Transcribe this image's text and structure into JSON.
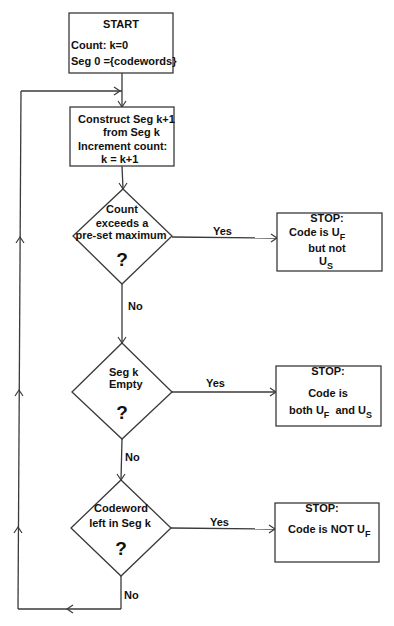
{
  "colors": {
    "background": "#ffffff",
    "line": "#3a3a3a",
    "text": "#111111"
  },
  "start": {
    "title": "START",
    "lines": [
      "Count: k=0",
      "Seg 0 ={codewords}"
    ]
  },
  "construct": {
    "lines": [
      "Construct Seg k+1",
      "from Seg k",
      "Increment count:",
      "k = k+1"
    ]
  },
  "decisions": [
    {
      "lines": [
        "Count",
        "exceeds a",
        "pre-set maximum"
      ],
      "mark": "?",
      "yes_label": "Yes",
      "no_label": "No"
    },
    {
      "lines": [
        "Seg k",
        "Empty"
      ],
      "mark": "?",
      "yes_label": "Yes",
      "no_label": "No"
    },
    {
      "lines": [
        "Codeword",
        "left in Seg k"
      ],
      "mark": "?",
      "yes_label": "Yes",
      "no_label": "No"
    }
  ],
  "stops": [
    {
      "title": "STOP:",
      "line1": {
        "text": "Code is U",
        "sub": "F"
      },
      "line2": "but not",
      "line3": {
        "text": "U",
        "sub": "S"
      }
    },
    {
      "title": "STOP:",
      "line1": "Code is",
      "line2": {
        "t1": "both U",
        "s1": "F",
        "t2": "  and U",
        "s2": "S"
      }
    },
    {
      "title": "STOP:",
      "line1": {
        "text": "Code is NOT U",
        "sub": "F"
      }
    }
  ]
}
